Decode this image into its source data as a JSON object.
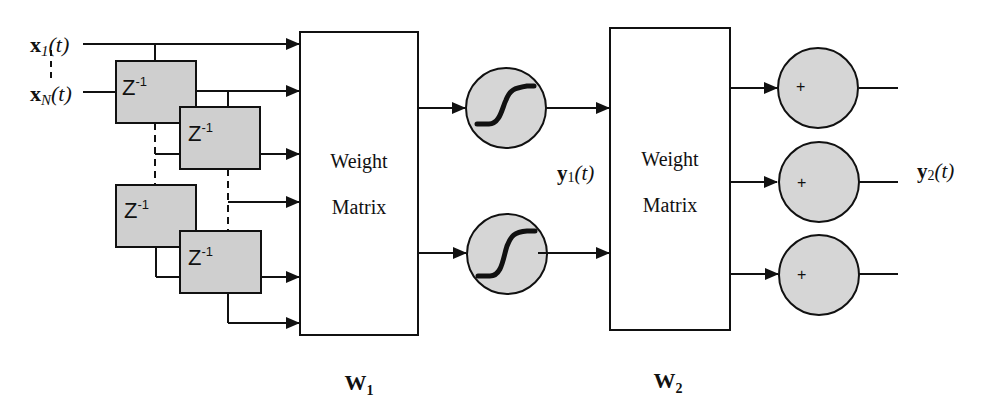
{
  "diagram": {
    "type": "time-delay neural network",
    "inputs": {
      "first": {
        "base": "x",
        "sub": "1",
        "arg": "(t)"
      },
      "last": {
        "base": "x",
        "sub": "N",
        "arg": "(t)"
      }
    },
    "delay_label": {
      "base": "Z",
      "sup": "-1"
    },
    "delay_blocks_count": 4,
    "weight_matrix_1": {
      "line1": "Weight",
      "line2": "Matrix",
      "caption_base": "W",
      "caption_sub": "1"
    },
    "weight_matrix_2": {
      "line1": "Weight",
      "line2": "Matrix",
      "caption_base": "W",
      "caption_sub": "2"
    },
    "hidden_output": {
      "base": "y",
      "sub": "1",
      "arg": "(t)"
    },
    "final_output": {
      "base": "y",
      "sub": "2",
      "arg": "(t)"
    },
    "sigmoid_nodes_count": 2,
    "sum_nodes": [
      {
        "symbol": "+"
      },
      {
        "symbol": "+"
      },
      {
        "symbol": "+"
      }
    ],
    "colors": {
      "line": "#111111",
      "block_fill": "#cfcfcf",
      "node_fill": "#d6d6d6",
      "background": "#ffffff"
    }
  }
}
